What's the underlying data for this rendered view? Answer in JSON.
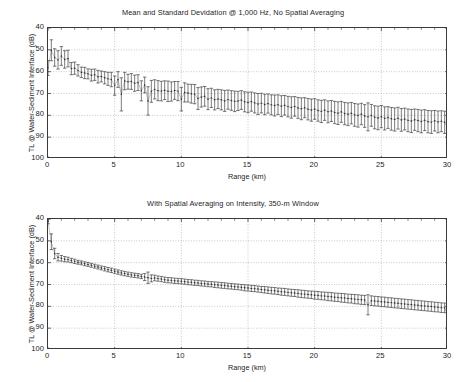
{
  "figure": {
    "width": 466,
    "height": 382,
    "background": "#ffffff",
    "ink_color": "#2b2b2b",
    "grid_color": "#9a9a9a",
    "axis_color": "#3a3a3a"
  },
  "chart_data": [
    {
      "type": "line",
      "panel": "top",
      "title": "Mean and Standard Devidation @ 1,000 Hz, No Spatial Averaging",
      "xlabel": "Range (km)",
      "ylabel": "TL @ Water-Sediment Interface (dB)",
      "xlim": [
        0,
        30
      ],
      "ylim": [
        40,
        100
      ],
      "y_inverted": true,
      "xticks": [
        0,
        5,
        10,
        15,
        20,
        25,
        30
      ],
      "yticks": [
        40,
        50,
        60,
        70,
        80,
        90,
        100
      ],
      "grid": true,
      "legend": null,
      "marker": "dot-with-errorbar",
      "series": [
        {
          "name": "Mean TL",
          "x": [
            0.0,
            0.25,
            0.5,
            0.75,
            1.0,
            1.25,
            1.5,
            1.75,
            2.0,
            2.25,
            2.5,
            2.75,
            3.0,
            3.25,
            3.5,
            3.75,
            4.0,
            4.25,
            4.5,
            4.75,
            5.0,
            5.25,
            5.5,
            5.75,
            6.0,
            6.25,
            6.5,
            6.75,
            7.0,
            7.25,
            7.5,
            7.75,
            8.0,
            8.25,
            8.5,
            8.75,
            9.0,
            9.25,
            9.5,
            9.75,
            10.0,
            10.25,
            10.5,
            10.75,
            11.0,
            11.25,
            11.5,
            11.75,
            12.0,
            12.25,
            12.5,
            12.75,
            13.0,
            13.25,
            13.5,
            13.75,
            14.0,
            14.25,
            14.5,
            14.75,
            15.0,
            15.25,
            15.5,
            15.75,
            16.0,
            16.25,
            16.5,
            16.75,
            17.0,
            17.25,
            17.5,
            17.75,
            18.0,
            18.25,
            18.5,
            18.75,
            19.0,
            19.25,
            19.5,
            19.75,
            20.0,
            20.25,
            20.5,
            20.75,
            21.0,
            21.25,
            21.5,
            21.75,
            22.0,
            22.25,
            22.5,
            22.75,
            23.0,
            23.25,
            23.5,
            23.75,
            24.0,
            24.25,
            24.5,
            24.75,
            25.0,
            25.25,
            25.5,
            25.75,
            26.0,
            26.25,
            26.5,
            26.75,
            27.0,
            27.25,
            27.5,
            27.75,
            28.0,
            28.25,
            28.5,
            28.75,
            29.0,
            29.25,
            29.5,
            29.75,
            30.0
          ],
          "mean": [
            58.3,
            50.2,
            53.5,
            54.6,
            52.8,
            54.4,
            54.0,
            58.6,
            58.4,
            59.4,
            60.3,
            60.6,
            61.0,
            61.6,
            61.4,
            62.3,
            62.2,
            62.8,
            63.3,
            63.6,
            66.4,
            63.6,
            70.4,
            64.3,
            64.6,
            64.5,
            65.3,
            65.0,
            68.8,
            66.1,
            73.4,
            69.0,
            68.1,
            68.7,
            68.9,
            68.5,
            69.0,
            69.1,
            68.6,
            68.9,
            72.6,
            69.5,
            69.8,
            70.1,
            70.3,
            72.3,
            71.6,
            71.3,
            72.6,
            72.0,
            72.9,
            72.5,
            72.9,
            73.4,
            72.8,
            73.2,
            73.6,
            73.4,
            73.0,
            73.8,
            74.1,
            73.7,
            74.3,
            74.8,
            74.4,
            75.0,
            74.6,
            75.2,
            75.5,
            75.1,
            75.8,
            75.4,
            76.0,
            76.4,
            75.9,
            76.6,
            77.0,
            76.5,
            77.2,
            77.6,
            77.1,
            77.8,
            78.2,
            77.6,
            78.4,
            78.0,
            78.7,
            79.0,
            78.4,
            79.2,
            79.5,
            79.0,
            79.8,
            80.1,
            79.4,
            80.3,
            80.7,
            80.0,
            80.9,
            81.2,
            80.6,
            81.4,
            81.0,
            81.6,
            81.9,
            81.3,
            82.1,
            81.7,
            82.3,
            82.6,
            82.0,
            82.4,
            82.8,
            82.2,
            82.9,
            83.1,
            82.5,
            83.0,
            82.7,
            83.2,
            86.0
          ],
          "std": [
            3.4,
            4.8,
            4.0,
            4.2,
            4.3,
            4.0,
            3.8,
            2.8,
            2.8,
            2.6,
            2.4,
            2.6,
            2.3,
            2.7,
            2.6,
            2.9,
            2.5,
            2.8,
            3.0,
            3.3,
            4.4,
            3.6,
            7.6,
            4.0,
            3.4,
            3.6,
            3.7,
            3.6,
            4.6,
            3.6,
            6.5,
            5.0,
            4.4,
            4.6,
            4.5,
            4.3,
            4.7,
            4.4,
            4.1,
            4.4,
            5.4,
            4.4,
            4.1,
            4.3,
            4.4,
            5.0,
            4.6,
            4.5,
            4.8,
            4.4,
            4.6,
            4.4,
            4.6,
            4.8,
            4.4,
            4.5,
            4.7,
            4.4,
            4.3,
            4.6,
            4.7,
            4.4,
            4.6,
            4.8,
            4.5,
            4.7,
            4.4,
            4.6,
            4.8,
            4.5,
            4.8,
            4.5,
            4.7,
            4.9,
            4.5,
            4.8,
            5.0,
            4.6,
            4.9,
            5.1,
            4.7,
            4.9,
            5.1,
            4.7,
            5.0,
            4.8,
            5.1,
            5.2,
            4.8,
            5.1,
            5.2,
            4.9,
            5.2,
            5.3,
            4.9,
            5.2,
            6.4,
            5.0,
            5.3,
            5.4,
            5.1,
            5.3,
            5.0,
            5.2,
            5.3,
            5.0,
            5.2,
            5.0,
            5.2,
            5.3,
            4.9,
            5.1,
            5.2,
            4.8,
            5.1,
            5.2,
            4.7,
            5.0,
            4.8,
            5.1,
            4.2
          ]
        }
      ]
    },
    {
      "type": "line",
      "panel": "bottom",
      "title": "With Spatial Averaging on Intensity, 350-m Window",
      "xlabel": "Range (km)",
      "ylabel": "TL @ Water-Sediment Interface (dB)",
      "xlim": [
        0,
        30
      ],
      "ylim": [
        40,
        100
      ],
      "y_inverted": true,
      "xticks": [
        0,
        5,
        10,
        15,
        20,
        25,
        30
      ],
      "yticks": [
        40,
        50,
        60,
        70,
        80,
        90,
        100
      ],
      "grid": true,
      "legend": null,
      "marker": "dot-with-errorbar",
      "series": [
        {
          "name": "Mean TL (350-m spatial average)",
          "x": [
            0.0,
            0.25,
            0.5,
            0.75,
            1.0,
            1.25,
            1.5,
            1.75,
            2.0,
            2.25,
            2.5,
            2.75,
            3.0,
            3.25,
            3.5,
            3.75,
            4.0,
            4.25,
            4.5,
            4.75,
            5.0,
            5.25,
            5.5,
            5.75,
            6.0,
            6.25,
            6.5,
            6.75,
            7.0,
            7.25,
            7.5,
            7.75,
            8.0,
            8.25,
            8.5,
            8.75,
            9.0,
            9.25,
            9.5,
            9.75,
            10.0,
            10.25,
            10.5,
            10.75,
            11.0,
            11.25,
            11.5,
            11.75,
            12.0,
            12.25,
            12.5,
            12.75,
            13.0,
            13.25,
            13.5,
            13.75,
            14.0,
            14.25,
            14.5,
            14.75,
            15.0,
            15.25,
            15.5,
            15.75,
            16.0,
            16.25,
            16.5,
            16.75,
            17.0,
            17.25,
            17.5,
            17.75,
            18.0,
            18.25,
            18.5,
            18.75,
            19.0,
            19.25,
            19.5,
            19.75,
            20.0,
            20.25,
            20.5,
            20.75,
            21.0,
            21.25,
            21.5,
            21.75,
            22.0,
            22.25,
            22.5,
            22.75,
            23.0,
            23.25,
            23.5,
            23.75,
            24.0,
            24.25,
            24.5,
            24.75,
            25.0,
            25.25,
            25.5,
            25.75,
            26.0,
            26.25,
            26.5,
            26.75,
            27.0,
            27.25,
            27.5,
            27.75,
            28.0,
            28.25,
            28.5,
            28.75,
            29.0,
            29.25,
            29.5,
            29.75,
            30.0
          ],
          "mean": [
            41.0,
            50.4,
            55.8,
            57.5,
            58.0,
            58.4,
            58.6,
            59.0,
            59.4,
            59.8,
            60.1,
            60.5,
            60.8,
            61.2,
            61.6,
            62.0,
            62.4,
            62.8,
            63.2,
            63.5,
            63.9,
            64.3,
            64.7,
            65.0,
            65.3,
            65.6,
            65.8,
            66.0,
            66.3,
            66.6,
            66.9,
            67.2,
            67.0,
            67.3,
            67.5,
            67.8,
            68.0,
            68.1,
            68.3,
            68.4,
            68.5,
            68.7,
            68.9,
            69.0,
            69.2,
            69.3,
            69.5,
            69.6,
            69.8,
            69.9,
            70.1,
            70.2,
            70.4,
            70.5,
            70.7,
            70.8,
            71.0,
            71.1,
            71.3,
            71.5,
            71.6,
            71.8,
            71.9,
            72.1,
            72.3,
            72.4,
            72.6,
            72.8,
            72.9,
            73.1,
            73.3,
            73.4,
            73.6,
            73.8,
            73.9,
            74.1,
            74.3,
            74.4,
            74.6,
            74.7,
            74.9,
            75.0,
            75.2,
            75.3,
            75.5,
            75.6,
            75.8,
            75.9,
            76.1,
            76.2,
            76.4,
            76.5,
            76.7,
            76.8,
            77.0,
            77.1,
            79.3,
            77.4,
            77.6,
            77.7,
            77.9,
            78.0,
            78.2,
            78.3,
            78.5,
            78.6,
            78.8,
            78.9,
            79.1,
            79.2,
            79.4,
            79.5,
            79.7,
            79.8,
            80.0,
            80.1,
            80.3,
            80.4,
            80.6,
            80.7,
            84.5
          ],
          "std": [
            1.2,
            3.6,
            2.4,
            1.7,
            1.3,
            1.2,
            1.1,
            1.0,
            1.0,
            0.9,
            0.9,
            0.9,
            0.9,
            0.9,
            0.9,
            0.9,
            0.9,
            1.0,
            1.0,
            1.0,
            1.0,
            1.0,
            1.0,
            1.0,
            1.0,
            1.0,
            1.0,
            1.0,
            1.0,
            1.6,
            2.6,
            1.6,
            1.3,
            1.2,
            1.2,
            1.2,
            1.2,
            1.2,
            1.2,
            1.2,
            1.2,
            1.2,
            1.2,
            1.2,
            1.2,
            1.2,
            1.2,
            1.2,
            1.2,
            1.2,
            1.3,
            1.3,
            1.3,
            1.3,
            1.3,
            1.3,
            1.3,
            1.3,
            1.3,
            1.4,
            1.4,
            1.4,
            1.4,
            1.4,
            1.4,
            1.5,
            1.5,
            1.5,
            1.5,
            1.5,
            1.6,
            1.6,
            1.6,
            1.6,
            1.6,
            1.7,
            1.7,
            1.7,
            1.7,
            1.7,
            1.8,
            1.8,
            1.8,
            1.8,
            1.9,
            1.9,
            1.9,
            1.9,
            2.0,
            2.0,
            2.0,
            2.0,
            2.1,
            2.1,
            2.1,
            2.1,
            4.6,
            2.2,
            2.2,
            2.2,
            2.2,
            2.2,
            2.2,
            2.2,
            2.2,
            2.2,
            2.2,
            2.2,
            2.2,
            2.2,
            2.2,
            2.2,
            2.2,
            2.2,
            2.2,
            2.2,
            2.2,
            2.2,
            2.2,
            2.2,
            1.6
          ]
        }
      ]
    }
  ]
}
